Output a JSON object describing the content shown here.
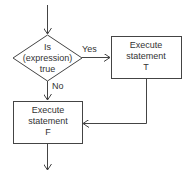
{
  "diagram": {
    "title": "",
    "decision": {
      "line1": "Is",
      "line2": "(expression)",
      "line3": "true"
    },
    "branch_yes": "Yes",
    "branch_no": "No",
    "box_t": {
      "line1": "Execute",
      "line2": "statement",
      "line3": "T"
    },
    "box_f": {
      "line1": "Execute",
      "line2": "statement",
      "line3": "F"
    },
    "colors": {
      "stroke": "#444444",
      "text": "#333333",
      "background": "#ffffff"
    }
  }
}
